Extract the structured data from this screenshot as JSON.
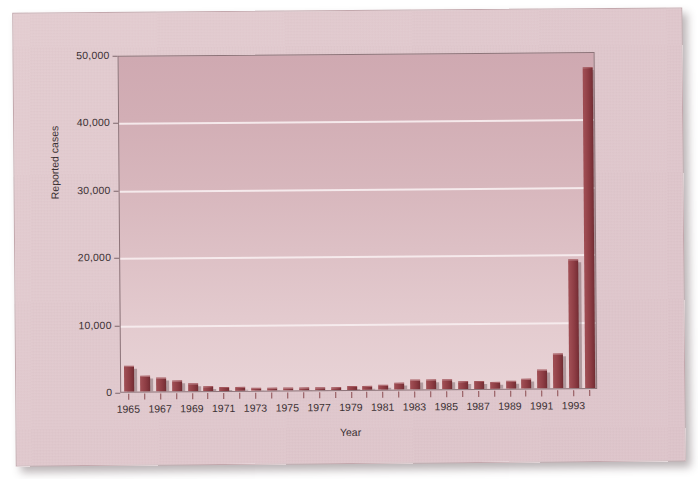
{
  "chart_data": {
    "type": "bar",
    "title": "",
    "xlabel": "Year",
    "ylabel": "Reported cases",
    "ylim": [
      0,
      50000
    ],
    "yticks": [
      0,
      10000,
      20000,
      30000,
      40000,
      50000
    ],
    "ytick_labels": [
      "0",
      "10,000",
      "20,000",
      "30,000",
      "40,000",
      "50,000"
    ],
    "grid": "horizontal",
    "legend": "none",
    "bar_color": "#8e3d44",
    "plot_bg_top": "#cfa9b1",
    "plot_bg_bottom": "#e8d3d6",
    "page_bg": "#e0c8cd",
    "gridline_color": "#f7ecee",
    "categories": [
      "1965",
      "1966",
      "1967",
      "1968",
      "1969",
      "1970",
      "1971",
      "1972",
      "1973",
      "1974",
      "1975",
      "1976",
      "1977",
      "1978",
      "1979",
      "1980",
      "1981",
      "1982",
      "1983",
      "1984",
      "1985",
      "1986",
      "1987",
      "1988",
      "1989",
      "1990",
      "1991",
      "1992",
      "1993",
      "1994"
    ],
    "xtick_labels_shown": [
      "1965",
      "1967",
      "1969",
      "1971",
      "1973",
      "1975",
      "1977",
      "1979",
      "1981",
      "1983",
      "1985",
      "1987",
      "1989",
      "1991",
      "1993"
    ],
    "values": [
      3700,
      2300,
      1900,
      1550,
      1000,
      650,
      400,
      400,
      350,
      350,
      300,
      350,
      350,
      350,
      400,
      450,
      600,
      900,
      1400,
      1300,
      1400,
      1000,
      1100,
      900,
      1000,
      1300,
      2600,
      5000,
      19000,
      47500
    ]
  }
}
